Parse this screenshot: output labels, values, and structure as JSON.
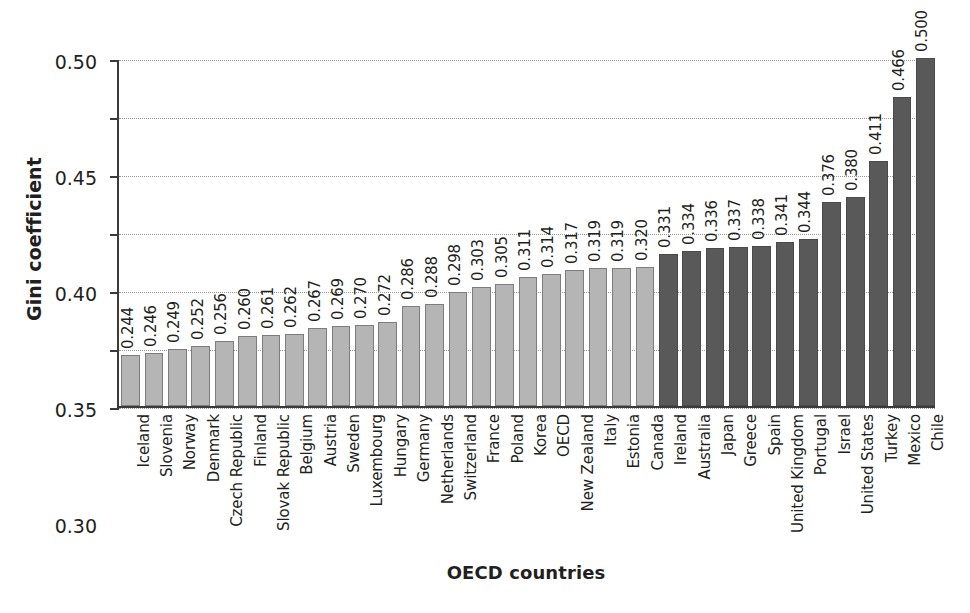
{
  "chart_data": {
    "type": "bar",
    "title": "",
    "xlabel": "OECD countries",
    "ylabel": "Gini coefficient",
    "ylim": [
      0.2,
      0.5
    ],
    "ytick_labels": [
      "0.50",
      "0.45",
      "0.40",
      "0.35",
      "0.30",
      "0.25",
      "0.20"
    ],
    "ytick_values": [
      0.5,
      0.45,
      0.4,
      0.35,
      0.3,
      0.25,
      0.2
    ],
    "grid": true,
    "legend": "none",
    "colors": {
      "below_average": "#b5b5b5",
      "above_average": "#595959",
      "axis": "#3a3a3a",
      "gridline": "#9a9a9a",
      "text": "#231f20"
    },
    "categories": [
      "Iceland",
      "Slovenia",
      "Norway",
      "Denmark",
      "Czech Republic",
      "Finland",
      "Slovak Republic",
      "Belgium",
      "Austria",
      "Sweden",
      "Luxembourg",
      "Hungary",
      "Germany",
      "Netherlands",
      "Switzerland",
      "France",
      "Poland",
      "Korea",
      "OECD",
      "New Zealand",
      "Italy",
      "Estonia",
      "Canada",
      "Ireland",
      "Australia",
      "Japan",
      "Greece",
      "Spain",
      "United Kingdom",
      "Portugal",
      "Israel",
      "United States",
      "Turkey",
      "Mexico",
      "Chile"
    ],
    "values": [
      0.244,
      0.246,
      0.249,
      0.252,
      0.256,
      0.26,
      0.261,
      0.262,
      0.267,
      0.269,
      0.27,
      0.272,
      0.286,
      0.288,
      0.298,
      0.303,
      0.305,
      0.311,
      0.314,
      0.317,
      0.319,
      0.319,
      0.32,
      0.331,
      0.334,
      0.336,
      0.337,
      0.338,
      0.341,
      0.344,
      0.376,
      0.38,
      0.411,
      0.466,
      0.5
    ],
    "value_labels": [
      "0.244",
      "0.246",
      "0.249",
      "0.252",
      "0.256",
      "0.260",
      "0.261",
      "0.262",
      "0.267",
      "0.269",
      "0.270",
      "0.272",
      "0.286",
      "0.288",
      "0.298",
      "0.303",
      "0.305",
      "0.311",
      "0.314",
      "0.317",
      "0.319",
      "0.319",
      "0.320",
      "0.331",
      "0.334",
      "0.336",
      "0.337",
      "0.338",
      "0.341",
      "0.344",
      "0.376",
      "0.380",
      "0.411",
      "0.466",
      "0.500"
    ],
    "shades": [
      "light",
      "light",
      "light",
      "light",
      "light",
      "light",
      "light",
      "light",
      "light",
      "light",
      "light",
      "light",
      "light",
      "light",
      "light",
      "light",
      "light",
      "light",
      "light",
      "light",
      "light",
      "light",
      "light",
      "dark",
      "dark",
      "dark",
      "dark",
      "dark",
      "dark",
      "dark",
      "dark",
      "dark",
      "dark",
      "dark",
      "dark"
    ]
  }
}
